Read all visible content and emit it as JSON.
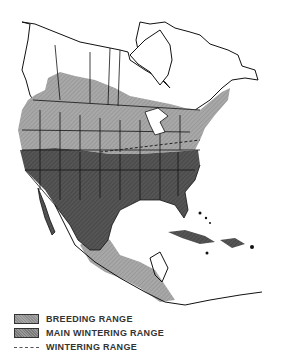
{
  "map": {
    "region": "North America",
    "colors": {
      "breeding": "#a3a3a3",
      "wintering": "#4a4a4a",
      "outline": "#111111",
      "land": "#ffffff"
    }
  },
  "legend": {
    "items": [
      {
        "label": "BREEDING RANGE",
        "type": "swatch-light"
      },
      {
        "label": "MAIN WINTERING RANGE",
        "type": "swatch-dark"
      },
      {
        "label": "WINTERING RANGE",
        "type": "dashed-line"
      }
    ]
  }
}
